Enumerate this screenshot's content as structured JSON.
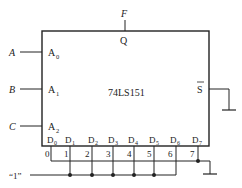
{
  "chip": {
    "name": "74LS151",
    "output_pin": "Q",
    "output_signal": "F",
    "enable_pin": "S",
    "select_pins": [
      {
        "pin": "A",
        "sub": "0",
        "signal": "A"
      },
      {
        "pin": "A",
        "sub": "1",
        "signal": "B"
      },
      {
        "pin": "A",
        "sub": "2",
        "signal": "C"
      }
    ],
    "data_pins": [
      {
        "pin": "D",
        "sub": "0",
        "number": "0",
        "connection": "ground"
      },
      {
        "pin": "D",
        "sub": "1",
        "number": "1",
        "connection": "logic-1"
      },
      {
        "pin": "D",
        "sub": "2",
        "number": "2",
        "connection": "logic-1"
      },
      {
        "pin": "D",
        "sub": "3",
        "number": "3",
        "connection": "logic-1"
      },
      {
        "pin": "D",
        "sub": "4",
        "number": "4",
        "connection": "logic-1"
      },
      {
        "pin": "D",
        "sub": "5",
        "number": "5",
        "connection": "logic-1"
      },
      {
        "pin": "D",
        "sub": "6",
        "number": "6",
        "connection": "logic-1"
      },
      {
        "pin": "D",
        "sub": "7",
        "number": "7",
        "connection": "ground"
      }
    ]
  },
  "logic_one_label": "“1”",
  "colors": {
    "line": "#222222",
    "background": "#ffffff"
  }
}
